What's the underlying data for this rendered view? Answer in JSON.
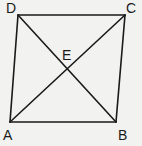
{
  "diagram": {
    "stroke_color": "#1a1a1a",
    "background": "#f2f2f0",
    "points": {
      "A": {
        "label": "A",
        "x": 10,
        "y": 122,
        "lx": 3,
        "ly": 140
      },
      "B": {
        "label": "B",
        "x": 116,
        "y": 122,
        "lx": 118,
        "ly": 140
      },
      "C": {
        "label": "C",
        "x": 125,
        "y": 15,
        "lx": 126,
        "ly": 13
      },
      "D": {
        "label": "D",
        "x": 18,
        "y": 15,
        "lx": 6,
        "ly": 13
      },
      "E": {
        "label": "E",
        "x": 67,
        "y": 69,
        "lx": 62,
        "ly": 60
      }
    },
    "segments": [
      "AB",
      "BC",
      "CD",
      "DA",
      "AC",
      "BD"
    ]
  }
}
